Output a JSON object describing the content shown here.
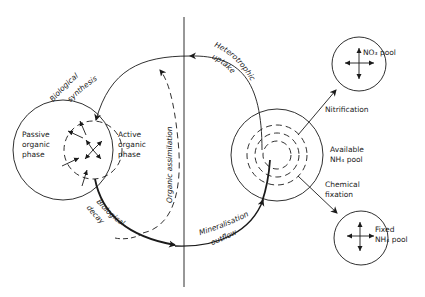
{
  "diagram": {
    "title": "",
    "nodes": {
      "organic": {
        "passive_label": [
          "Passive",
          "organic",
          "phase"
        ],
        "active_label": [
          "Active",
          "organic",
          "phase"
        ]
      },
      "nh4_available": {
        "label": [
          "Available",
          "NH₄ pool"
        ]
      },
      "no3": {
        "label": "NO₃ pool"
      },
      "nh4_fixed": {
        "label": [
          "Fixed",
          "NH₄ pool"
        ]
      }
    },
    "flows": {
      "biological_synthesis": [
        "Biological",
        "synthesis"
      ],
      "heterotrophic_uptake": [
        "Heterotrophic",
        "uptake"
      ],
      "organic_assimilation": "Organic assimilation",
      "biological_decay": [
        "Biological",
        "decay"
      ],
      "mineralisation_outflow": [
        "Mineralisation",
        "outflow"
      ],
      "nitrification": "Nitrification",
      "chemical_fixation": [
        "Chemical",
        "fixation"
      ]
    },
    "colors": {
      "line": "#1a1a1a",
      "background": "#ffffff"
    }
  }
}
